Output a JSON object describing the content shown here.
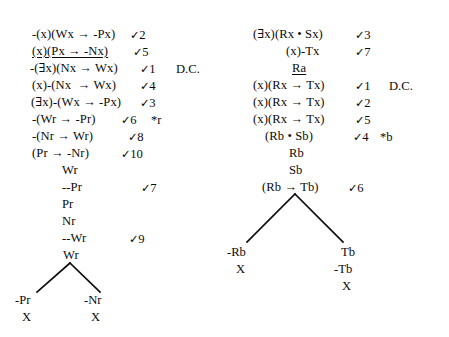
{
  "document": {
    "title": "Predicate Logic Truth Tree Proofs",
    "background_color": "#ffffff",
    "text_color": "#0b0b0b",
    "line_color": "#0f0f0f",
    "check_symbol": "✓",
    "discharge_note": "D.C."
  },
  "left_tree": {
    "name": "left-truth-tree",
    "stem": [
      {
        "formula": "-(x)(Wx → -Px)",
        "check": "✓2",
        "note": "",
        "underlined": false,
        "x": 32,
        "y": 28,
        "check_x": 130,
        "note_x": 0
      },
      {
        "formula": "(x)(Px → -Nx)",
        "check": "✓5",
        "note": "",
        "underlined": true,
        "x": 32,
        "y": 45,
        "check_x": 133,
        "note_x": 0
      },
      {
        "formula": "-(∃x)(Nx → Wx)",
        "check": "✓1",
        "note": "D.C.",
        "underlined": false,
        "x": 30,
        "y": 62,
        "check_x": 140,
        "note_x": 176
      },
      {
        "formula": "(x)-(Nx  → Wx)",
        "check": "✓4",
        "note": "",
        "underlined": false,
        "x": 32,
        "y": 79,
        "check_x": 140,
        "note_x": 0
      },
      {
        "formula": "(∃x)-(Wx → -Px)",
        "check": "✓3",
        "note": "",
        "underlined": false,
        "x": 31,
        "y": 96,
        "check_x": 140,
        "note_x": 0
      },
      {
        "formula": "-(Wr → -Pr)",
        "check": "✓6",
        "note": "*r",
        "underlined": false,
        "x": 32,
        "y": 113,
        "check_x": 121,
        "note_x": 151
      },
      {
        "formula": "-(Nr → Wr)",
        "check": "✓8",
        "note": "",
        "underlined": false,
        "x": 32,
        "y": 130,
        "check_x": 128,
        "note_x": 0
      },
      {
        "formula": "(Pr → -Nr)",
        "check": "✓10",
        "note": "",
        "underlined": false,
        "x": 32,
        "y": 147,
        "check_x": 121,
        "note_x": 0
      },
      {
        "formula": "Wr",
        "check": "",
        "note": "",
        "underlined": false,
        "x": 62,
        "y": 164,
        "check_x": 0,
        "note_x": 0
      },
      {
        "formula": "--Pr",
        "check": "✓7",
        "note": "",
        "underlined": false,
        "x": 62,
        "y": 181,
        "check_x": 141,
        "note_x": 0
      },
      {
        "formula": "Pr",
        "check": "",
        "note": "",
        "underlined": false,
        "x": 62,
        "y": 198,
        "check_x": 0,
        "note_x": 0
      },
      {
        "formula": "Nr",
        "check": "",
        "note": "",
        "underlined": false,
        "x": 62,
        "y": 215,
        "check_x": 0,
        "note_x": 0
      },
      {
        "formula": "--Wr",
        "check": "✓9",
        "note": "",
        "underlined": false,
        "x": 62,
        "y": 232,
        "check_x": 129,
        "note_x": 0
      },
      {
        "formula": "Wr",
        "check": "",
        "note": "",
        "underlined": false,
        "x": 63,
        "y": 249,
        "check_x": 0,
        "note_x": 0
      }
    ],
    "branch": {
      "apex_x": 70,
      "apex_y": 263,
      "left_x": 37,
      "left_y": 292,
      "right_x": 100,
      "right_y": 292
    },
    "leaves": [
      {
        "formula": "-Pr",
        "closure": "X",
        "x": 15,
        "y": 293,
        "closure_x": 22,
        "closure_y": 310
      },
      {
        "formula": "-Nr",
        "closure": "X",
        "x": 84,
        "y": 293,
        "closure_x": 91,
        "closure_y": 310
      }
    ]
  },
  "right_tree": {
    "name": "right-truth-tree",
    "stem": [
      {
        "formula": "(∃x)(Rx • Sx)",
        "check": "✓3",
        "note": "",
        "underlined": false,
        "x": 253,
        "y": 28,
        "check_x": 355,
        "note_x": 0
      },
      {
        "formula": "(x)-Tx",
        "check": "✓7",
        "note": "",
        "underlined": false,
        "x": 286,
        "y": 45,
        "check_x": 355,
        "note_x": 0
      },
      {
        "formula": "Ra",
        "check": "",
        "note": "",
        "underlined": true,
        "x": 292,
        "y": 62,
        "check_x": 0,
        "note_x": 0
      },
      {
        "formula": "(x)(Rx → Tx)",
        "check": "✓1",
        "note": "D.C.",
        "underlined": false,
        "x": 253,
        "y": 79,
        "check_x": 355,
        "note_x": 389
      },
      {
        "formula": "(x)(Rx → Tx)",
        "check": "✓2",
        "note": "",
        "underlined": false,
        "x": 253,
        "y": 96,
        "check_x": 355,
        "note_x": 0
      },
      {
        "formula": "(x)(Rx → Tx)",
        "check": "✓5",
        "note": "",
        "underlined": false,
        "x": 253,
        "y": 113,
        "check_x": 355,
        "note_x": 0
      },
      {
        "formula": "(Rb • Sb)",
        "check": "✓4",
        "note": "*b",
        "underlined": false,
        "x": 265,
        "y": 130,
        "check_x": 353,
        "note_x": 380
      },
      {
        "formula": "Rb",
        "check": "",
        "note": "",
        "underlined": false,
        "x": 289,
        "y": 147,
        "check_x": 0,
        "note_x": 0
      },
      {
        "formula": "Sb",
        "check": "",
        "note": "",
        "underlined": false,
        "x": 289,
        "y": 164,
        "check_x": 0,
        "note_x": 0
      },
      {
        "formula": "(Rb → Tb)",
        "check": "✓6",
        "note": "",
        "underlined": false,
        "x": 262,
        "y": 181,
        "check_x": 348,
        "note_x": 0
      }
    ],
    "branch": {
      "apex_x": 295,
      "apex_y": 194,
      "left_x": 247,
      "left_y": 242,
      "right_x": 343,
      "right_y": 242
    },
    "leaves": [
      {
        "formula": "-Rb",
        "closure": "X",
        "x": 227,
        "y": 245,
        "closure_x": 236,
        "closure_y": 262
      },
      {
        "formula": "Tb",
        "closure": "",
        "x": 341,
        "y": 245,
        "closure_x": 0,
        "closure_y": 0
      },
      {
        "formula": "-Tb",
        "closure": "X",
        "x": 334,
        "y": 262,
        "closure_x": 342,
        "closure_y": 279
      }
    ]
  }
}
